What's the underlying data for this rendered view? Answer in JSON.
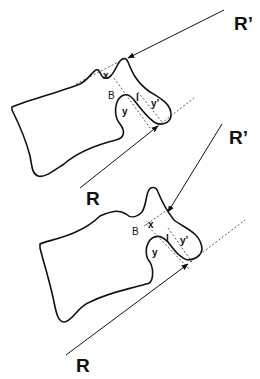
{
  "diagram": {
    "top": {
      "force_upper_label": "R’",
      "force_lower_label": "R",
      "labels": {
        "x": "x",
        "B": "B",
        "l": "l",
        "y": "y",
        "y_prime": "y’"
      }
    },
    "bottom": {
      "force_upper_label": "R’",
      "force_lower_label": "R",
      "labels": {
        "x": "x",
        "B": "B",
        "l": "l",
        "y": "y",
        "y_prime": "y’"
      }
    },
    "colors": {
      "stroke": "#111111",
      "background": "#ffffff"
    }
  }
}
